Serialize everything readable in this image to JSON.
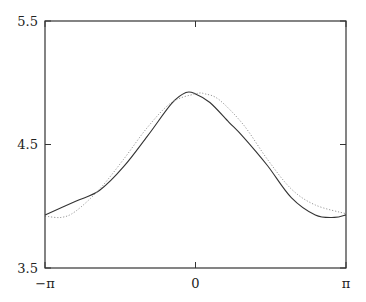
{
  "chart_data": {
    "type": "line",
    "title": "",
    "xlabel": "",
    "ylabel": "",
    "xlim": [
      -3.14159,
      3.14159
    ],
    "ylim": [
      3.5,
      5.5
    ],
    "grid": false,
    "legend": null,
    "x_ticks": [
      {
        "value": -3.14159,
        "label": "−π"
      },
      {
        "value": 0,
        "label": "0"
      },
      {
        "value": 3.14159,
        "label": "π"
      }
    ],
    "y_ticks": [
      {
        "value": 3.5,
        "label": "3.5"
      },
      {
        "value": 4.5,
        "label": "4.5"
      },
      {
        "value": 5.5,
        "label": "5.5"
      }
    ],
    "series": [
      {
        "name": "solid",
        "style": "solid",
        "color": "#333333",
        "x": [
          -3.14,
          -2.5,
          -2.0,
          -1.5,
          -1.0,
          -0.5,
          -0.2,
          0.0,
          0.3,
          0.7,
          1.0,
          1.5,
          2.0,
          2.5,
          2.9,
          3.14
        ],
        "y": [
          3.93,
          4.04,
          4.13,
          4.32,
          4.57,
          4.83,
          4.92,
          4.91,
          4.84,
          4.68,
          4.56,
          4.33,
          4.07,
          3.93,
          3.91,
          3.93
        ]
      },
      {
        "name": "dotted",
        "style": "dotted",
        "color": "#999999",
        "x": [
          -3.14,
          -2.8,
          -2.5,
          -2.0,
          -1.5,
          -1.0,
          -0.5,
          0.0,
          0.2,
          0.5,
          1.0,
          1.5,
          2.0,
          2.5,
          3.14
        ],
        "y": [
          3.92,
          3.91,
          3.96,
          4.14,
          4.38,
          4.64,
          4.84,
          4.91,
          4.91,
          4.86,
          4.66,
          4.38,
          4.14,
          4.01,
          3.94
        ]
      }
    ]
  }
}
